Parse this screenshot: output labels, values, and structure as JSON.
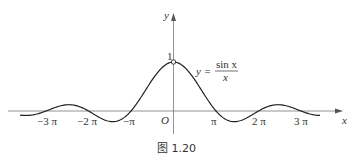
{
  "chart_data": {
    "type": "line",
    "title": "",
    "function": "y = sin x / x",
    "xlabel": "x",
    "ylabel": "y",
    "origin_label": "O",
    "y_tick_label": "1",
    "x_tick_labels": [
      "-3π",
      "-2π",
      "-π",
      "π",
      "2π",
      "3π"
    ],
    "x_tick_values": [
      -9.4248,
      -6.2832,
      -3.1416,
      3.1416,
      6.2832,
      9.4248
    ],
    "xlim": [
      -12.5,
      12.5
    ],
    "ylim": [
      -0.25,
      1.15
    ],
    "grid": false,
    "series": [
      {
        "name": "y = sin x / x",
        "x": [
          -12,
          -10.5,
          -9.4248,
          -7.7,
          -6.2832,
          -4.5,
          -3.1416,
          -1.5,
          0,
          1.5,
          3.1416,
          4.5,
          6.2832,
          7.7,
          9.4248,
          10.5,
          12
        ],
        "values": [
          -0.045,
          -0.083,
          0,
          0.128,
          0,
          -0.217,
          0,
          0.665,
          1,
          0.665,
          0,
          -0.217,
          0,
          0.128,
          0,
          -0.083,
          -0.045
        ]
      }
    ],
    "annotations": [
      {
        "text": "y = sin x / x",
        "position": "right of peak"
      },
      {
        "text": "hollow point at (0, 1)"
      }
    ]
  },
  "labels": {
    "x_axis": "x",
    "y_axis": "y",
    "origin": "O",
    "one": "1",
    "neg3pi": "−3 π",
    "neg2pi": "−2 π",
    "negpi": "−π",
    "pi": "π",
    "twopi": "2 π",
    "threepi": "3 π",
    "formula_lhs": "y =",
    "formula_num": "sin x",
    "formula_den": "x"
  },
  "caption": "图 1.20"
}
